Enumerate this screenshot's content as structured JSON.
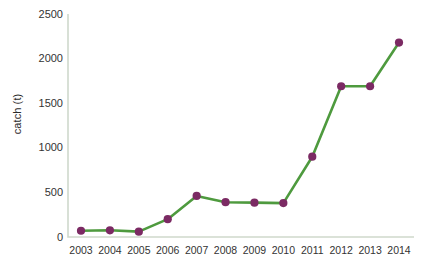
{
  "chart_data": {
    "type": "line",
    "title": "",
    "xlabel": "",
    "ylabel": "catch (t)",
    "categories": [
      "2003",
      "2004",
      "2005",
      "2006",
      "2007",
      "2008",
      "2009",
      "2010",
      "2011",
      "2012",
      "2013",
      "2014"
    ],
    "values": [
      70,
      75,
      60,
      200,
      460,
      390,
      385,
      380,
      900,
      1690,
      1690,
      2180
    ],
    "series": [
      {
        "name": "catch",
        "values": [
          70,
          75,
          60,
          200,
          460,
          390,
          385,
          380,
          900,
          1690,
          1690,
          2180
        ]
      }
    ],
    "ylim": [
      0,
      2500
    ],
    "y_ticks": [
      "0",
      "500",
      "1000",
      "1500",
      "2000",
      "2500"
    ],
    "y_tick_values": [
      0,
      500,
      1000,
      1500,
      2000,
      2500
    ],
    "x_tick_labels": [
      "2003",
      "2004",
      "2005",
      "2006",
      "2007",
      "2008",
      "2009",
      "2010",
      "2011",
      "2012",
      "2013",
      "2014"
    ],
    "grid": false,
    "legend": "none",
    "colors": {
      "line": "#4e9a3e",
      "marker": "#7b2a63",
      "axis": "#cfd9cc",
      "text": "#333333",
      "background": "#ffffff"
    }
  }
}
